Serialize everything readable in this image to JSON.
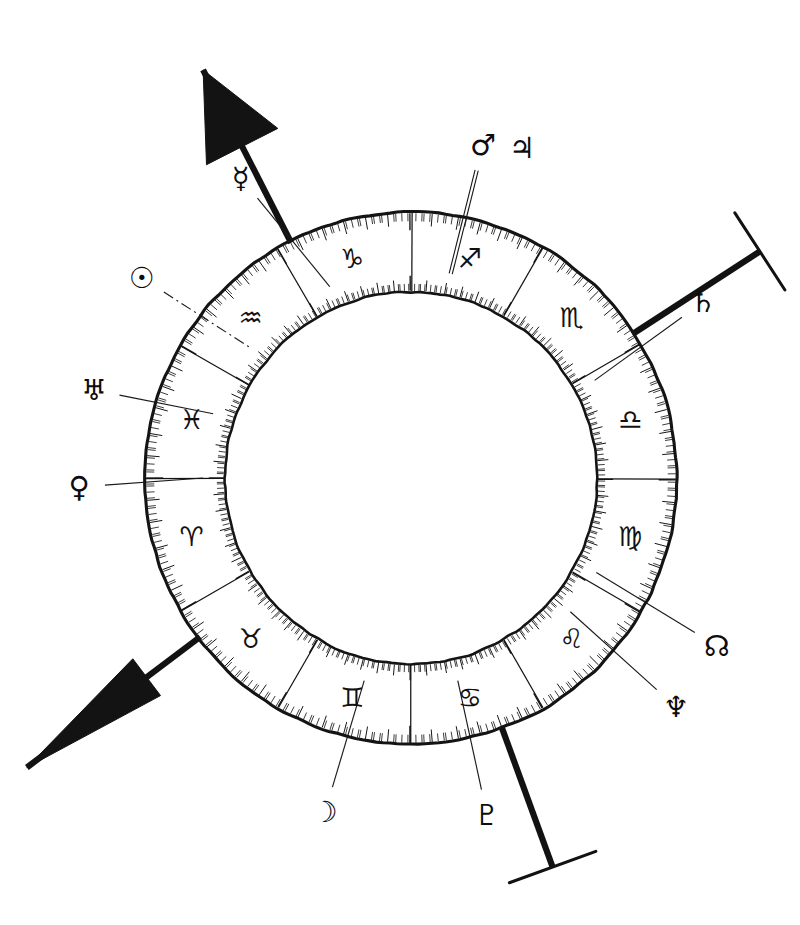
{
  "figure": {
    "name": "zodiac-wheel-diagram",
    "kind": "astrological natal chart wheel",
    "background_color": "#ffffff",
    "ink_color": "#121212"
  },
  "wheel": {
    "center_x": 411,
    "center_y": 478,
    "outer_radius": 266,
    "inner_radius": 186,
    "sector_count": 12,
    "degrees_per_sector": 30,
    "sector_boundary_top_angle_deg": 90,
    "tick_marks": {
      "outer_edge": "degree ticks pointing inward from outer rim",
      "inner_edge": "degree ticks pointing outward from inner rim",
      "minor_every_deg": 1,
      "major_every_deg": 5
    },
    "signs": [
      {
        "name": "Capricorn",
        "glyph": "♑",
        "sector_index": 0,
        "mid_angle_deg": 105
      },
      {
        "name": "Aquarius",
        "glyph": "♒",
        "sector_index": 1,
        "mid_angle_deg": 135
      },
      {
        "name": "Pisces",
        "glyph": "♓",
        "sector_index": 2,
        "mid_angle_deg": 165
      },
      {
        "name": "Aries",
        "glyph": "♈",
        "sector_index": 3,
        "mid_angle_deg": 195
      },
      {
        "name": "Taurus",
        "glyph": "♉",
        "sector_index": 4,
        "mid_angle_deg": 225
      },
      {
        "name": "Gemini",
        "glyph": "♊",
        "sector_index": 5,
        "mid_angle_deg": 255
      },
      {
        "name": "Cancer",
        "glyph": "♋",
        "sector_index": 6,
        "mid_angle_deg": 285
      },
      {
        "name": "Leo",
        "glyph": "♌",
        "sector_index": 7,
        "mid_angle_deg": 315
      },
      {
        "name": "Virgo",
        "glyph": "♍",
        "sector_index": 8,
        "mid_angle_deg": 345
      },
      {
        "name": "Libra",
        "glyph": "♎",
        "sector_index": 9,
        "mid_angle_deg": 15
      },
      {
        "name": "Scorpio",
        "glyph": "♏",
        "sector_index": 10,
        "mid_angle_deg": 45
      },
      {
        "name": "Sagittarius",
        "glyph": "♐",
        "sector_index": 11,
        "mid_angle_deg": 75
      }
    ]
  },
  "planets": [
    {
      "name": "Mercury",
      "glyph": "☿",
      "label_x": 241,
      "label_y": 178,
      "point_angle_deg": 113,
      "pointer": "solid"
    },
    {
      "name": "Mars",
      "glyph": "♂",
      "label_x": 483,
      "label_y": 145,
      "point_angle_deg": 79,
      "pointer": "double"
    },
    {
      "name": "Jupiter",
      "glyph": "♃",
      "label_x": 522,
      "label_y": 148,
      "point_angle_deg": 79,
      "pointer": "none"
    },
    {
      "name": "Sun",
      "glyph": "☉",
      "label_x": 142,
      "label_y": 278,
      "point_angle_deg": 141,
      "pointer": "dashed"
    },
    {
      "name": "Saturn",
      "glyph": "♄",
      "label_x": 703,
      "label_y": 302,
      "point_angle_deg": 28,
      "pointer": "solid"
    },
    {
      "name": "Uranus",
      "glyph": "♅",
      "label_x": 94,
      "label_y": 390,
      "point_angle_deg": 162,
      "pointer": "solid"
    },
    {
      "name": "Venus",
      "glyph": "♀",
      "label_x": 79,
      "label_y": 487,
      "point_angle_deg": 180,
      "pointer": "solid"
    },
    {
      "name": "North Node",
      "glyph": "☊",
      "label_x": 717,
      "label_y": 646,
      "point_angle_deg": -27,
      "pointer": "solid"
    },
    {
      "name": "Neptune",
      "glyph": "♆",
      "label_x": 676,
      "label_y": 707,
      "point_angle_deg": -40,
      "pointer": "solid"
    },
    {
      "name": "Moon",
      "glyph": "☽",
      "label_x": 325,
      "label_y": 812,
      "point_angle_deg": 257,
      "pointer": "solid"
    },
    {
      "name": "Pluto",
      "glyph": "♇",
      "label_x": 487,
      "label_y": 815,
      "point_angle_deg": 283,
      "pointer": "solid"
    }
  ],
  "axes": [
    {
      "name": "ascendant-descendant-axis",
      "style": "thick line with solid arrowheads at both ends",
      "upper_end_angle_deg": 117,
      "lower_end_angle_deg": 217,
      "arrow_upper": "large filled triangle pointing up-left",
      "arrow_lower": "long slender filled spike pointing down-left"
    },
    {
      "name": "midheaven-imum-coeli-axis",
      "style": "thick line terminated by a short perpendicular cross bar",
      "upper_end_angle_deg": 33,
      "lower_end_angle_deg": 290,
      "terminal_upper": "perpendicular bar (MC marker)",
      "terminal_lower": "perpendicular bar (IC marker)"
    }
  ]
}
